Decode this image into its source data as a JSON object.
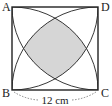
{
  "diagram": {
    "shape": "square",
    "vertices": {
      "top_left": "A",
      "top_right": "D",
      "bottom_left": "B",
      "bottom_right": "C"
    },
    "side_length_label": "12 cm",
    "arcs": "four quarter circles centered at each vertex, radius equal to side",
    "shaded_region": "central curvilinear region bounded by the four arcs",
    "colors": {
      "stroke": "#222222",
      "shade": "#d6d6d6",
      "background": "#ffffff"
    }
  }
}
